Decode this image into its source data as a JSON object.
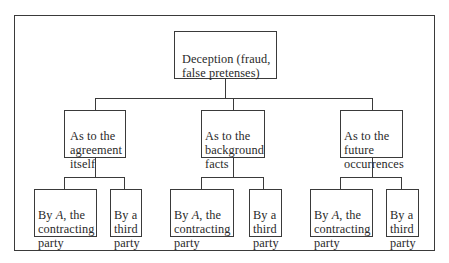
{
  "diagram": {
    "type": "tree",
    "root": {
      "label": "Deception (fraud,\nfalse pretenses)"
    },
    "level2": [
      {
        "label": "As to the\nagreement\nitself",
        "children": [
          {
            "label_pre": "By ",
            "label_italic": "A",
            "label_post": ", the\ncontracting\nparty"
          },
          {
            "label": "By a\nthird\nparty"
          }
        ]
      },
      {
        "label": "As to the\nbackground\nfacts",
        "children": [
          {
            "label_pre": "By ",
            "label_italic": "A",
            "label_post": ", the\ncontracting\nparty"
          },
          {
            "label": "By a\nthird\nparty"
          }
        ]
      },
      {
        "label": "As to the\nfuture\noccurrences",
        "children": [
          {
            "label_pre": "By ",
            "label_italic": "A",
            "label_post": ", the\ncontracting\nparty"
          },
          {
            "label": "By a\nthird\nparty"
          }
        ]
      }
    ]
  },
  "colors": {
    "line": "#3a3a3a",
    "text": "#2a2a2a",
    "background": "#ffffff"
  }
}
